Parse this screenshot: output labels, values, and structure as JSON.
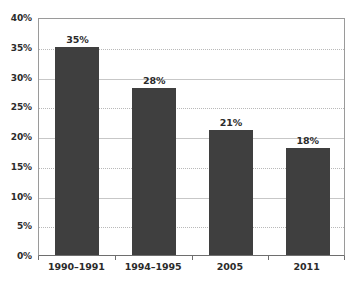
{
  "chart_data": {
    "type": "bar",
    "title": "",
    "subtitle": "",
    "xlabel": "",
    "ylabel": "",
    "categories": [
      "1990–1991",
      "1994–1995",
      "2005",
      "2011"
    ],
    "values": [
      35,
      28,
      21,
      18
    ],
    "data_labels": [
      "35%",
      "28%",
      "21%",
      "18%"
    ],
    "ylim": [
      0,
      40
    ],
    "ytick_values": [
      0,
      5,
      10,
      15,
      20,
      25,
      30,
      35,
      40
    ],
    "ytick_labels": [
      "0%",
      "5%",
      "10%",
      "15%",
      "20%",
      "25%",
      "30%",
      "35%",
      "40%"
    ],
    "grid": true,
    "grid_axis": "y",
    "legend": false,
    "legend_position": "none",
    "series": [
      {
        "name": "",
        "values": [
          35,
          28,
          21,
          18
        ]
      }
    ],
    "colors": {
      "bar_fill": "#3f3f3f",
      "gridline": "#b9b9b9",
      "axis_line": "#6e6e6e",
      "plot_border": "#9a9a9a",
      "text": "#2b2b2b",
      "background": "#ffffff"
    }
  }
}
